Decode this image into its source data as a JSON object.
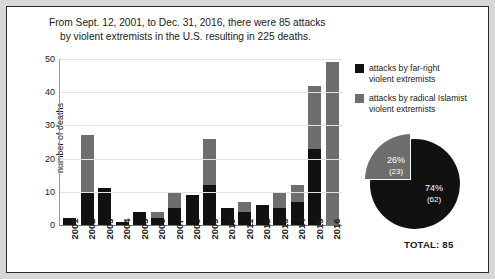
{
  "title": {
    "line1": "From Sept. 12, 2001, to Dec. 31, 2016, there were 85 attacks",
    "line2": "by violent extremists in the U.S. resulting in 225 deaths."
  },
  "legend": {
    "items": [
      {
        "label": "attacks by far-right violent extremists",
        "line1": "attacks by far-right",
        "line2": "violent extremists",
        "color": "#111111",
        "swatch": "black"
      },
      {
        "label": "attacks by radical Islamist violent extremists",
        "line1": "attacks by radical Islamist",
        "line2": "violent extremists",
        "color": "#6e6e6e",
        "swatch": "gray"
      }
    ]
  },
  "pie_labels": {
    "gray_pct": "26%",
    "gray_count": "(23)",
    "black_pct": "74%",
    "black_count": "(62)",
    "total": "TOTAL: 85"
  },
  "chart_data": [
    {
      "type": "bar",
      "title": "From Sept. 12, 2001, to Dec. 31, 2016, there were 85 attacks by violent extremists in the U.S. resulting in 225 deaths.",
      "stacked": true,
      "xlabel": "",
      "ylabel": "number of deaths",
      "ylim": [
        0,
        50
      ],
      "yticks": [
        0,
        10,
        20,
        30,
        40,
        50
      ],
      "grid": true,
      "legend_position": "right",
      "categories": [
        "2001",
        "2002",
        "2003",
        "2004",
        "2005",
        "2006",
        "2007",
        "2008",
        "2009",
        "2010",
        "2011",
        "2012",
        "2013",
        "2014",
        "2015",
        "2016"
      ],
      "series": [
        {
          "name": "attacks by far-right violent extremists",
          "color": "#111111",
          "values": [
            2,
            10,
            11,
            1,
            4,
            2,
            5,
            9,
            12,
            5,
            4,
            6,
            5,
            7,
            23,
            0
          ]
        },
        {
          "name": "attacks by radical Islamist violent extremists",
          "color": "#6e6e6e",
          "values": [
            0,
            17,
            0,
            0,
            0,
            2,
            5,
            0,
            14,
            0,
            3,
            0,
            5,
            5,
            19,
            49
          ]
        }
      ],
      "totals": [
        2,
        27,
        11,
        1,
        4,
        4,
        10,
        9,
        26,
        5,
        7,
        6,
        10,
        12,
        42,
        49
      ]
    },
    {
      "type": "pie",
      "title": "TOTAL: 85",
      "labels": [
        "attacks by far-right violent extremists",
        "attacks by radical Islamist violent extremists"
      ],
      "values": [
        62,
        23
      ],
      "percents": [
        74,
        26
      ],
      "colors": [
        "#111111",
        "#6e6e6e"
      ],
      "total": 85,
      "exploded": [
        false,
        true
      ]
    }
  ]
}
